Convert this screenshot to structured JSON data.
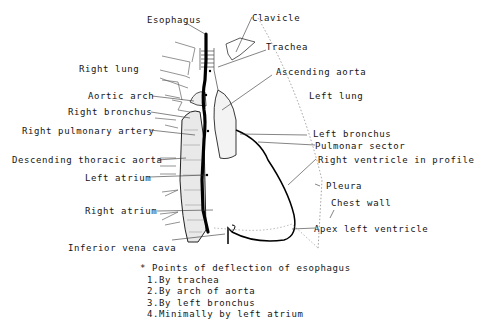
{
  "figure": {
    "labels": {
      "esophagus": "Esophagus",
      "clavicle": "Clavicle",
      "trachea": "Trachea",
      "right_lung": "Right lung",
      "ascending_aorta": "Ascending aorta",
      "aortic_arch": "Aortic arch",
      "left_lung": "Left lung",
      "right_bronchus": "Right bronchus",
      "right_pulmonary_artery": "Right pulmonary artery",
      "left_bronchus": "Left bronchus",
      "pulmonar_sector": "Pulmonar sector",
      "descending_thoracic_aorta": "Descending thoracic aorta",
      "right_ventricle_in_profile": "Right ventricle in profile",
      "left_atrium": "Left atrium",
      "pleura": "Pleura",
      "chest_wall": "Chest wall",
      "right_atrium": "Right atrium",
      "apex_left_ventricle": "Apex left ventricle",
      "inferior_vena_cava": "Inferior vena cava"
    },
    "legend": {
      "title": "* Points of deflection of esophagus",
      "items": [
        "1.By trachea",
        "2.By arch of aorta",
        "3.By left bronchus",
        "4.Minimally by left atrium"
      ]
    },
    "colors": {
      "ink": "#111111",
      "background": "#ffffff",
      "dotted": "#888888"
    }
  }
}
